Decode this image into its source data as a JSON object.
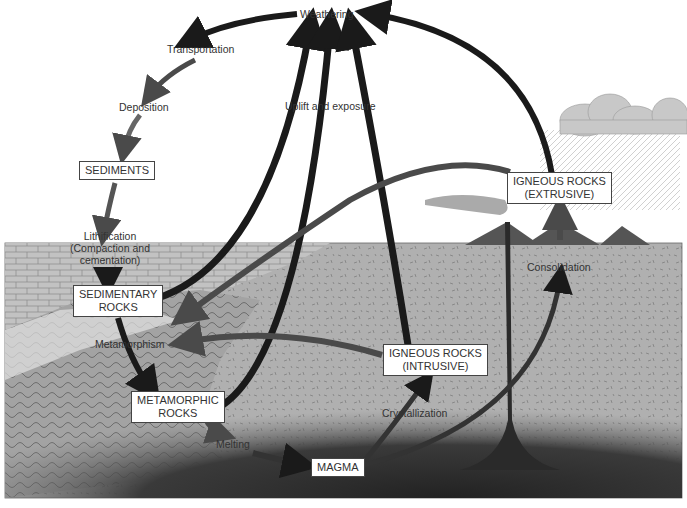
{
  "colors": {
    "sky": "#ffffff",
    "ground": "#b3b3b3",
    "sediment_layer": "#c4c4c4",
    "metamorphic_zone": "#9a9a9a",
    "magma": "#2a2a2a",
    "arrow_dark": "#1a1a1a",
    "arrow_mid": "#4a4a4a",
    "cloud": "#c8c8c8",
    "volcano": "#555555"
  },
  "process_labels": {
    "weathering": "Weathering",
    "transportation": "Transportation",
    "deposition": "Deposition",
    "uplift": "Uplift and exposure",
    "lithification_1": "Lithification",
    "lithification_2": "(Compaction and",
    "lithification_3": "cementation)",
    "metamorphism": "Metamorphism",
    "melting": "Melting",
    "crystallization": "Crystallization",
    "consolidation": "Consolidation"
  },
  "rock_boxes": {
    "sediments": "SEDIMENTS",
    "sedimentary_1": "SEDIMENTARY",
    "sedimentary_2": "ROCKS",
    "metamorphic_1": "METAMORPHIC",
    "metamorphic_2": "ROCKS",
    "igneous_intrusive_1": "IGNEOUS ROCKS",
    "igneous_intrusive_2": "(INTRUSIVE)",
    "igneous_extrusive_1": "IGNEOUS ROCKS",
    "igneous_extrusive_2": "(EXTRUSIVE)",
    "magma": "MAGMA"
  }
}
